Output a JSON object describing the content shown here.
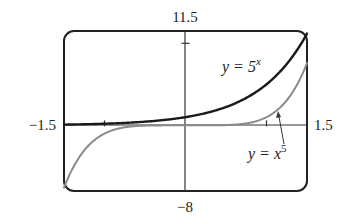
{
  "chart_data": {
    "type": "line",
    "title": "",
    "xlabel": "",
    "ylabel": "",
    "xlim": [
      -1.5,
      1.5
    ],
    "ylim": [
      -8,
      11.5
    ],
    "grid": false,
    "axis_labels": {
      "x_min": "−1.5",
      "x_max": "1.5",
      "y_max": "11.5",
      "y_min": "−8"
    },
    "ticks": {
      "x": [
        -1,
        1
      ],
      "y": [
        10
      ]
    },
    "series": [
      {
        "name": "y = 5^x",
        "label_text": "y = 5",
        "label_sup": "x",
        "color": "#1a1a1a",
        "function": "5^x",
        "x": [
          -1.5,
          -1.25,
          -1.0,
          -0.75,
          -0.5,
          -0.25,
          0,
          0.25,
          0.5,
          0.75,
          1.0,
          1.25,
          1.5
        ],
        "values": [
          0.09,
          0.13,
          0.2,
          0.3,
          0.45,
          0.67,
          1.0,
          1.5,
          2.24,
          3.34,
          5.0,
          7.48,
          11.18
        ]
      },
      {
        "name": "y = x^5",
        "label_text": "y = x",
        "label_sup": "5",
        "color": "#8a8a8a",
        "function": "x^5",
        "x": [
          -1.5,
          -1.25,
          -1.0,
          -0.75,
          -0.5,
          -0.25,
          0,
          0.25,
          0.5,
          0.75,
          1.0,
          1.25,
          1.5
        ],
        "values": [
          -7.59,
          -3.05,
          -1.0,
          -0.24,
          -0.03,
          0.0,
          0.0,
          0.0,
          0.03,
          0.24,
          1.0,
          3.05,
          7.59
        ]
      }
    ],
    "annotations": [
      {
        "text": "y = 5^x",
        "target_series": "y = 5^x"
      },
      {
        "text": "y = x^5",
        "target_series": "y = x^5",
        "arrow": true
      }
    ]
  }
}
